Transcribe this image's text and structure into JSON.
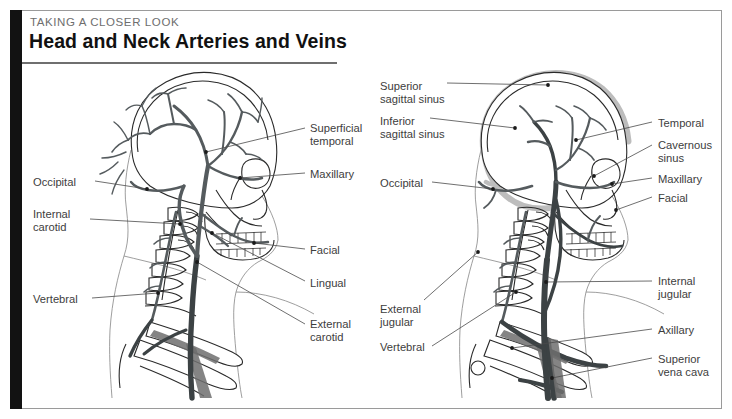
{
  "header": {
    "eyebrow": "TAKING A CLOSER LOOK",
    "title": "Head and Neck Arteries and Veins"
  },
  "figure": {
    "left_panel": {
      "name": "arteries-diagram",
      "labels_left": [
        {
          "id": "occipital",
          "text": "Occipital",
          "x": 33,
          "y": 176
        },
        {
          "id": "internal-carotid",
          "text": "Internal\ncarotid",
          "x": 33,
          "y": 208
        },
        {
          "id": "vertebral",
          "text": "Vertebral",
          "x": 33,
          "y": 293
        }
      ],
      "labels_right": [
        {
          "id": "superficial-temporal",
          "text": "Superficial\ntemporal",
          "x": 310,
          "y": 122
        },
        {
          "id": "maxillary",
          "text": "Maxillary",
          "x": 310,
          "y": 168
        },
        {
          "id": "facial",
          "text": "Facial",
          "x": 310,
          "y": 244
        },
        {
          "id": "lingual",
          "text": "Lingual",
          "x": 310,
          "y": 277
        },
        {
          "id": "external-carotid",
          "text": "External\ncarotid",
          "x": 310,
          "y": 318
        }
      ]
    },
    "right_panel": {
      "name": "veins-diagram",
      "labels_left": [
        {
          "id": "superior-sagittal-sinus",
          "text": "Superior\nsagittal sinus",
          "x": 380,
          "y": 80
        },
        {
          "id": "inferior-sagittal-sinus",
          "text": "Inferior\nsagittal sinus",
          "x": 380,
          "y": 115
        },
        {
          "id": "occipital-vein",
          "text": "Occipital",
          "x": 380,
          "y": 177
        },
        {
          "id": "external-jugular",
          "text": "External\njugular",
          "x": 380,
          "y": 303
        },
        {
          "id": "vertebral-vein",
          "text": "Vertebral",
          "x": 380,
          "y": 341
        }
      ],
      "labels_right": [
        {
          "id": "temporal",
          "text": "Temporal",
          "x": 658,
          "y": 117
        },
        {
          "id": "cavernous-sinus",
          "text": "Cavernous\nsinus",
          "x": 658,
          "y": 139
        },
        {
          "id": "maxillary-vein",
          "text": "Maxillary",
          "x": 658,
          "y": 173
        },
        {
          "id": "facial-vein",
          "text": "Facial",
          "x": 658,
          "y": 192
        },
        {
          "id": "internal-jugular",
          "text": "Internal\njugular",
          "x": 658,
          "y": 275
        },
        {
          "id": "axillary",
          "text": "Axillary",
          "x": 658,
          "y": 324
        },
        {
          "id": "superior-vena-cava",
          "text": "Superior\nvena cava",
          "x": 658,
          "y": 353
        }
      ]
    }
  },
  "colors": {
    "spine_bar": "#121212",
    "frame_border": "#9a9a9a",
    "title_text": "#111111",
    "eyebrow_text": "#6e6e6e",
    "label_text": "#3d3d3d",
    "vessel": "#555b5e",
    "sinus": "#bdbdbd",
    "bone_outline": "#2a2a2a",
    "silhouette": "#8d8d8d"
  }
}
